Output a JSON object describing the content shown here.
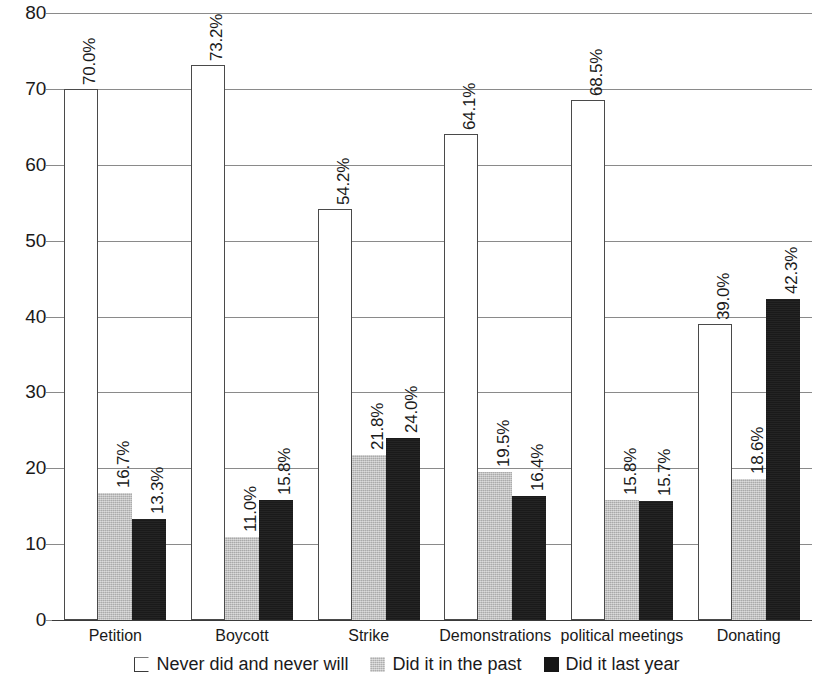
{
  "chart_data": {
    "type": "bar",
    "title": "",
    "subtitle": "",
    "xlabel": "",
    "ylabel": "",
    "ylim": [
      0,
      80
    ],
    "ytick_values": [
      0,
      10,
      20,
      30,
      40,
      50,
      60,
      70,
      80
    ],
    "ytick_labels": [
      "0",
      "10",
      "20",
      "30",
      "40",
      "50",
      "60",
      "70",
      "80"
    ],
    "grid": true,
    "legend_position": "bottom",
    "label_format": "percent_one_decimal",
    "categories": [
      "Petition",
      "Boycott",
      "Strike",
      "Demonstrations",
      "political meetings",
      "Donating"
    ],
    "series": [
      {
        "name": "Never did and never will",
        "color": "#ffffff",
        "edge_color": "#4a4a4a",
        "values": [
          70.0,
          73.2,
          54.2,
          64.1,
          68.5,
          39.0
        ],
        "labels": [
          "70.0%",
          "73.2%",
          "54.2%",
          "64.1%",
          "68.5%",
          "39.0%"
        ]
      },
      {
        "name": "Did it in the past",
        "color": "#bebebe",
        "edge_color": "#bebebe",
        "values": [
          16.7,
          11.0,
          21.8,
          19.5,
          15.8,
          18.6
        ],
        "labels": [
          "16.7%",
          "11.0%",
          "21.8%",
          "19.5%",
          "15.8%",
          "18.6%"
        ]
      },
      {
        "name": "Did it last year",
        "color": "#1a1a1a",
        "edge_color": "#1a1a1a",
        "values": [
          13.3,
          15.8,
          24.0,
          16.4,
          15.7,
          42.3
        ],
        "labels": [
          "13.3%",
          "15.8%",
          "24.0%",
          "16.4%",
          "15.7%",
          "42.3%"
        ]
      }
    ]
  }
}
